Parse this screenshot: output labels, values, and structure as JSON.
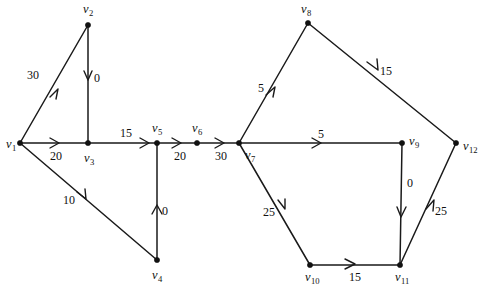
{
  "figure": {
    "type": "directed-weighted-graph",
    "width": 487,
    "height": 287,
    "background": "#ffffff",
    "ink_color": "#111111"
  },
  "vertices": [
    {
      "id": "v1",
      "label": "v",
      "sub": "1",
      "x": 20,
      "y": 143,
      "label_x": 11,
      "label_y": 144
    },
    {
      "id": "v2",
      "label": "v",
      "sub": "2",
      "x": 88,
      "y": 25,
      "label_x": 88,
      "label_y": 9
    },
    {
      "id": "v3",
      "label": "v",
      "sub": "3",
      "x": 88,
      "y": 143,
      "label_x": 89,
      "label_y": 158
    },
    {
      "id": "v4",
      "label": "v",
      "sub": "4",
      "x": 157,
      "y": 260,
      "label_x": 157,
      "label_y": 275
    },
    {
      "id": "v5",
      "label": "v",
      "sub": "5",
      "x": 157,
      "y": 143,
      "label_x": 157,
      "label_y": 128
    },
    {
      "id": "v6",
      "label": "v",
      "sub": "6",
      "x": 197,
      "y": 143,
      "label_x": 197,
      "label_y": 128
    },
    {
      "id": "v7",
      "label": "v",
      "sub": "7",
      "x": 239,
      "y": 143,
      "label_x": 250,
      "label_y": 155
    },
    {
      "id": "v8",
      "label": "v",
      "sub": "8",
      "x": 308,
      "y": 23,
      "label_x": 306,
      "label_y": 9
    },
    {
      "id": "v9",
      "label": "v",
      "sub": "9",
      "x": 402,
      "y": 143,
      "label_x": 414,
      "label_y": 141
    },
    {
      "id": "v10",
      "label": "v",
      "sub": "10",
      "x": 310,
      "y": 265,
      "label_x": 312,
      "label_y": 277
    },
    {
      "id": "v11",
      "label": "v",
      "sub": "11",
      "x": 400,
      "y": 265,
      "label_x": 402,
      "label_y": 277
    },
    {
      "id": "v12",
      "label": "v",
      "sub": "12",
      "x": 456,
      "y": 143,
      "label_x": 470,
      "label_y": 146
    }
  ],
  "edges": [
    {
      "id": "e-v1-v2",
      "from": "v1",
      "to": "v2",
      "weight": "30",
      "weight_x": 33,
      "weight_y": 75
    },
    {
      "id": "e-v2-v3",
      "from": "v2",
      "to": "v3",
      "weight": "0",
      "weight_x": 97,
      "weight_y": 78
    },
    {
      "id": "e-v1-v3",
      "from": "v1",
      "to": "v3",
      "weight": "20",
      "weight_x": 56,
      "weight_y": 156
    },
    {
      "id": "e-v1-v4",
      "from": "v1",
      "to": "v4",
      "weight": "10",
      "weight_x": 69,
      "weight_y": 200
    },
    {
      "id": "e-v4-v5",
      "from": "v4",
      "to": "v5",
      "weight": "0",
      "weight_x": 165,
      "weight_y": 211
    },
    {
      "id": "e-v3-v5",
      "from": "v3",
      "to": "v5",
      "weight": "15",
      "weight_x": 126,
      "weight_y": 133
    },
    {
      "id": "e-v5-v6",
      "from": "v5",
      "to": "v6",
      "weight": "20",
      "weight_x": 180,
      "weight_y": 156
    },
    {
      "id": "e-v6-v7",
      "from": "v6",
      "to": "v7",
      "weight": "30",
      "weight_x": 221,
      "weight_y": 156
    },
    {
      "id": "e-v7-v8",
      "from": "v7",
      "to": "v8",
      "weight": "5",
      "weight_x": 261,
      "weight_y": 88
    },
    {
      "id": "e-v8-v12",
      "from": "v8",
      "to": "v12",
      "weight": "15",
      "weight_x": 386,
      "weight_y": 71
    },
    {
      "id": "e-v7-v9",
      "from": "v7",
      "to": "v9",
      "weight": "5",
      "weight_x": 321,
      "weight_y": 134
    },
    {
      "id": "e-v9-v11",
      "from": "v9",
      "to": "v11",
      "weight": "0",
      "weight_x": 410,
      "weight_y": 183
    },
    {
      "id": "e-v7-v10",
      "from": "v7",
      "to": "v10",
      "weight": "25",
      "weight_x": 269,
      "weight_y": 212
    },
    {
      "id": "e-v10-v11",
      "from": "v10",
      "to": "v11",
      "weight": "15",
      "weight_x": 355,
      "weight_y": 277
    },
    {
      "id": "e-v11-v12",
      "from": "v11",
      "to": "v12",
      "weight": "25",
      "weight_x": 441,
      "weight_y": 211
    }
  ]
}
